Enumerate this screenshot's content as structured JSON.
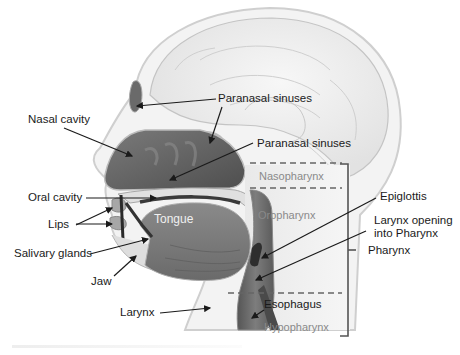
{
  "diagram": {
    "labels": {
      "paranasal_sinuses_upper": "Paranasal sinuses",
      "paranasal_sinuses_lower": "Paranasal sinuses",
      "nasal_cavity": "Nasal cavity",
      "oral_cavity": "Oral cavity",
      "lips": "Lips",
      "salivary_glands": "Salivary glands",
      "jaw": "Jaw",
      "tongue": "Tongue",
      "larynx": "Larynx",
      "epiglottis": "Epiglottis",
      "larynx_opening_line1": "Larynx opening",
      "larynx_opening_line2": "into Pharynx",
      "pharynx": "Pharynx",
      "esophagus": "Esophagus"
    },
    "regions": {
      "nasopharynx": "Nasopharynx",
      "oropharynx": "Oropharynx",
      "hypopharynx": "Hypopharynx"
    },
    "colors": {
      "label_text": "#1a1a1a",
      "region_text": "#8a8a8a",
      "bracket": "#555555",
      "dashed_divider": "#666666",
      "tissue_dark": "#5a5a5a",
      "tissue_mid": "#9a9a9a",
      "tissue_light": "#e4e4e4"
    }
  }
}
